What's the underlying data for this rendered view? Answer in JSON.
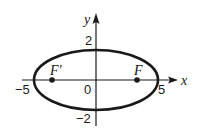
{
  "diagram": {
    "type": "ellipse-graph",
    "axes": {
      "x_label": "x",
      "y_label": "y",
      "x_ticks": [
        {
          "value": -5,
          "label": "−5"
        },
        {
          "value": 5,
          "label": "5"
        }
      ],
      "y_ticks": [
        {
          "value": 2,
          "label": "2"
        },
        {
          "value": -2,
          "label": "−2"
        }
      ],
      "origin_label": "0"
    },
    "ellipse": {
      "center": [
        0,
        0
      ],
      "semi_major_x": 5,
      "semi_minor_y": 2
    },
    "foci": [
      {
        "label": "F′",
        "x": -3.5,
        "y": 0
      },
      {
        "label": "F",
        "x": 3.5,
        "y": 0
      }
    ],
    "colors": {
      "stroke": "#1a1a1a",
      "background": "#ffffff"
    }
  }
}
